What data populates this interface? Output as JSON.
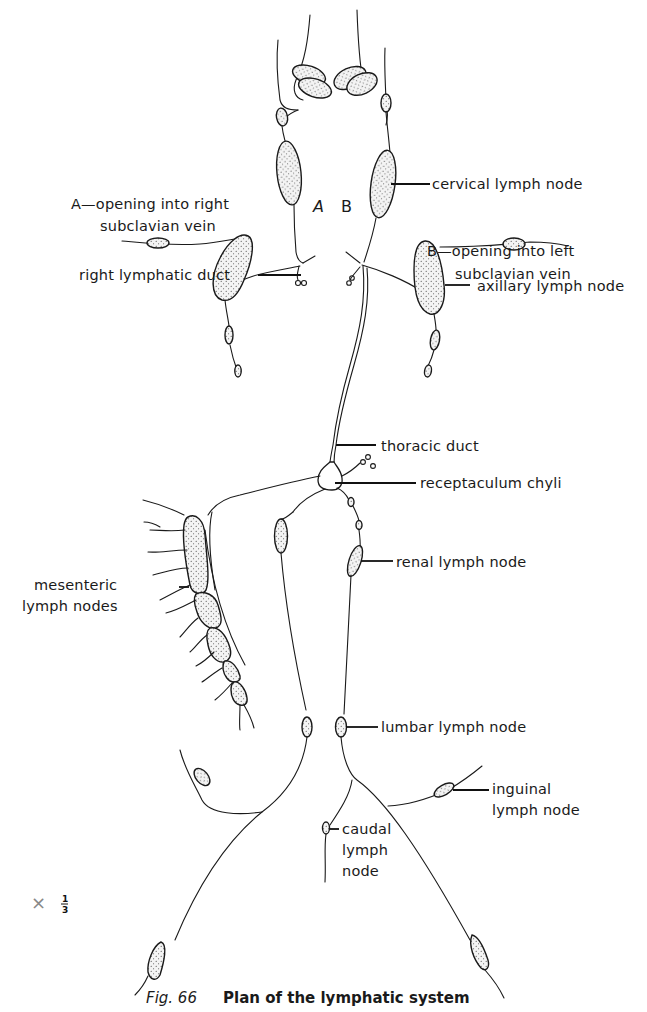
{
  "figure": {
    "number": "Fig. 66",
    "title": "Plan of the lymphatic system",
    "scale": {
      "symbol": "×",
      "numerator": "1",
      "denominator": "3"
    }
  },
  "markers": {
    "a": "A",
    "b": "B"
  },
  "labels": {
    "cervical": "cervical lymph node",
    "opening_a_line1": "A—opening into right",
    "opening_a_line2": "subclavian vein",
    "opening_b_line1": "B—opening into left",
    "opening_b_line2": "subclavian vein",
    "right_duct": "right lymphatic duct",
    "axillary": "axillary lymph node",
    "thoracic": "thoracic duct",
    "receptaculum": "receptaculum chyli",
    "renal": "renal lymph node",
    "mesenteric_line1": "mesenteric",
    "mesenteric_line2": "lymph nodes",
    "lumbar": "lumbar lymph node",
    "inguinal_line1": "inguinal",
    "inguinal_line2": "lymph node",
    "caudal_line1": "caudal",
    "caudal_line2": "lymph",
    "caudal_line3": "node"
  },
  "colors": {
    "ink": "#1a1a1a",
    "paper": "#ffffff",
    "scale_mark": "#888888"
  }
}
